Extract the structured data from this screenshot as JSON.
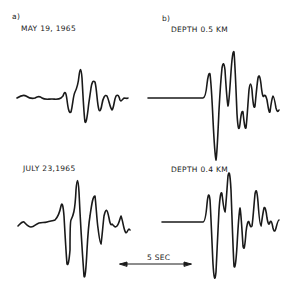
{
  "panel_a": {
    "label": "a)",
    "trace_top_title": "MAY 19, 1965",
    "trace_bottom_title": "JULY 23,1965"
  },
  "panel_b": {
    "label": "b)",
    "trace_top_title": "DEPTH  0.5 KM",
    "trace_bottom_title": "DEPTH  0.4 KM"
  },
  "scale_bar": {
    "label": "5 SEC"
  },
  "colors": {
    "ink": "#1a1a1a",
    "background": "#ffffff"
  }
}
